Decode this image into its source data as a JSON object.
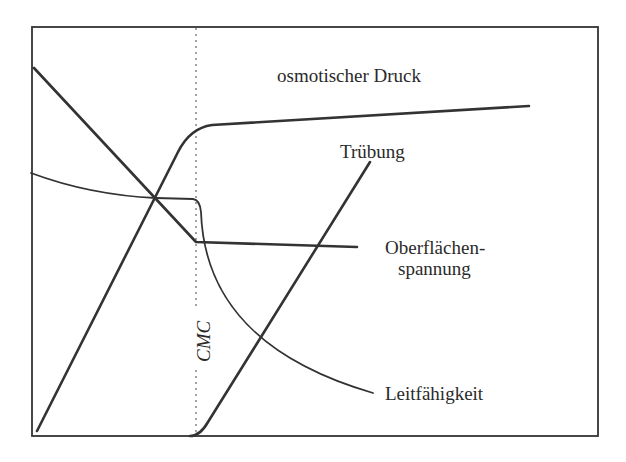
{
  "chart_data": {
    "type": "line",
    "title": "",
    "xlabel": "",
    "ylabel": "",
    "grid": false,
    "legend": "inline labels",
    "frame": {
      "x0": 32,
      "y0": 27,
      "x1": 598,
      "y1": 436,
      "color": "#333333"
    },
    "cmc_marker": {
      "label": "CMC",
      "x": 196,
      "style": "dotted vertical line",
      "label_rotation": -90
    },
    "series": [
      {
        "name": "osmotischer Druck",
        "description": "linear rise until CMC, then nearly flat",
        "points": [
          [
            37,
            431
          ],
          [
            175,
            158
          ],
          [
            186,
            138
          ],
          [
            196,
            129
          ],
          [
            208,
            125
          ],
          [
            529,
            106
          ]
        ],
        "path": "M37,431 L178,152 Q190,128 212,125 L529,106",
        "stroke_width": 2.6,
        "label": {
          "text": "osmotischer Druck",
          "x": 277,
          "y": 82
        }
      },
      {
        "name": "Trübung",
        "description": "zero until CMC, then linear rise",
        "points": [
          [
            190,
            436
          ],
          [
            206,
            420
          ],
          [
            260,
            338
          ],
          [
            316,
            246
          ],
          [
            370,
            162
          ]
        ],
        "path": "M190,436 Q200,436 208,422 L370,162",
        "stroke_width": 2.6,
        "label": {
          "text": "Trübung",
          "x": 340,
          "y": 158
        }
      },
      {
        "name": "Oberflächenspannung",
        "description": "linear decrease until CMC, then nearly constant",
        "points": [
          [
            34,
            68
          ],
          [
            156,
            198
          ],
          [
            196,
            242
          ],
          [
            316,
            246
          ],
          [
            357,
            247
          ]
        ],
        "path": "M34,68 L196,242 L357,247",
        "stroke_width": 2.6,
        "label": {
          "text": [
            "Oberflächen-",
            "spannung"
          ],
          "x": 385,
          "y": 254
        }
      },
      {
        "name": "Leitfähigkeit",
        "description": "slow decrease until CMC, then sharp drop and hyperbolic decay",
        "points": [
          [
            31,
            173
          ],
          [
            100,
            192
          ],
          [
            156,
            198
          ],
          [
            195,
            200
          ],
          [
            200,
            210
          ],
          [
            220,
            290
          ],
          [
            260,
            338
          ],
          [
            373,
            393
          ]
        ],
        "path": "M31,173 Q90,195 156,198 L193,199 Q200,200 201,212 C204,300 260,360 373,393",
        "stroke_width": 1.8,
        "label": {
          "text": "Leitfähigkeit",
          "x": 385,
          "y": 400
        }
      }
    ]
  },
  "labels": {
    "osmotic": "osmotischer Druck",
    "turbidity": "Trübung",
    "surface_tension_1": "Oberflächen-",
    "surface_tension_2": "spannung",
    "conductivity": "Leitfähigkeit",
    "cmc": "CMC"
  }
}
